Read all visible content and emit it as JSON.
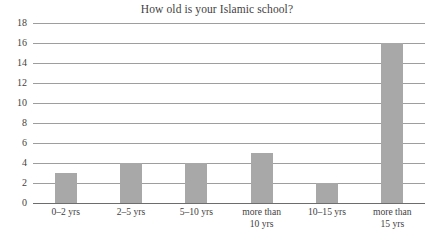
{
  "chart_data": {
    "type": "bar",
    "title": "How old is your Islamic school?",
    "xlabel": "",
    "ylabel": "",
    "categories": [
      "0–2 yrs",
      "2–5 yrs",
      "5–10 yrs",
      "more than 10 yrs",
      "10–15 yrs",
      "more than 15 yrs"
    ],
    "category_lines": [
      [
        "0–2 yrs"
      ],
      [
        "2–5 yrs"
      ],
      [
        "5–10 yrs"
      ],
      [
        "more than",
        "10 yrs"
      ],
      [
        "10–15 yrs"
      ],
      [
        "more than",
        "15 yrs"
      ]
    ],
    "values": [
      3,
      4,
      4,
      5,
      2,
      16
    ],
    "ylim": [
      0,
      18
    ],
    "ytick_step": 2,
    "yticks": [
      0,
      2,
      4,
      6,
      8,
      10,
      12,
      14,
      16,
      18
    ],
    "grid": true,
    "legend": "none",
    "colors": {
      "bar_fill": "#a8a8a8",
      "gridline": "#8d8d8d",
      "axis": "#6d6d6d",
      "text": "#3f3f3f",
      "background": "#ffffff"
    }
  }
}
